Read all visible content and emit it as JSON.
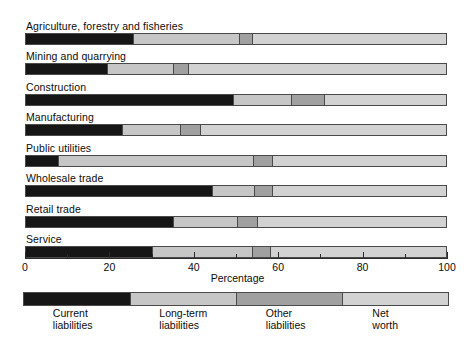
{
  "chart_data": {
    "type": "bar",
    "orientation": "horizontal",
    "stacked": true,
    "title": "",
    "xlabel": "Percentage",
    "ylabel": "",
    "xlim": [
      0,
      100
    ],
    "grid": false,
    "legend_position": "bottom",
    "categories": [
      "Agriculture, forestry and fisheries",
      "Mining and quarrying",
      "Construction",
      "Manufacturing",
      "Public utilities",
      "Wholesale trade",
      "Retail trade",
      "Service"
    ],
    "series": [
      {
        "name": "Current liabilities",
        "color": "#161616",
        "values": [
          25.5,
          19.3,
          49.3,
          22.9,
          7.5,
          44.3,
          35.0,
          30.0
        ]
      },
      {
        "name": "Long-term liabilities",
        "color": "#c6c6c6",
        "values": [
          25.1,
          15.7,
          13.9,
          13.8,
          46.5,
          10.1,
          15.2,
          23.7
        ]
      },
      {
        "name": "Other liabilities",
        "color": "#a0a0a0",
        "values": [
          3.1,
          3.6,
          7.8,
          4.7,
          4.5,
          4.1,
          4.7,
          4.3
        ]
      },
      {
        "name": "Net worth",
        "color": "#d2d2d2",
        "values": [
          46.3,
          61.4,
          29.0,
          58.6,
          41.5,
          41.5,
          45.1,
          42.0
        ]
      }
    ],
    "x_ticks": [
      0,
      20,
      40,
      60,
      80,
      100
    ],
    "x_minor_ticks": [
      10,
      30,
      50,
      70,
      90
    ],
    "x_tick_labels": [
      "0",
      "20",
      "40",
      "60",
      "80",
      "100"
    ]
  },
  "legend": {
    "swatch_widths": [
      25,
      25,
      25,
      25
    ],
    "items": [
      {
        "label": "Current\nliabilities",
        "color": "#161616"
      },
      {
        "label": "Long-term\nliabilities",
        "color": "#c6c6c6"
      },
      {
        "label": "Other\nliabilities",
        "color": "#a0a0a0"
      },
      {
        "label": "Net\nworth",
        "color": "#d2d2d2"
      }
    ]
  }
}
